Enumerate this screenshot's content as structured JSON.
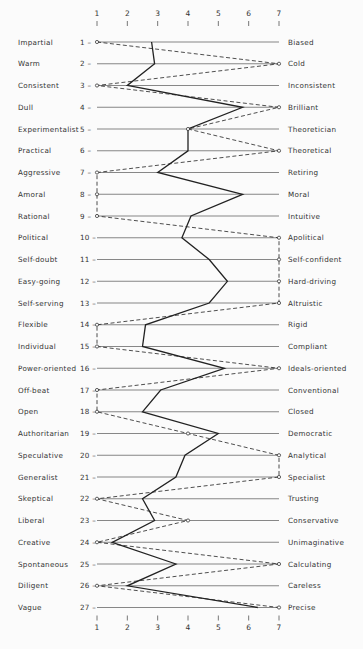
{
  "chart_data": {
    "type": "line",
    "title": "",
    "xlabel": "",
    "ylabel": "",
    "orientation": "horizontal-profile",
    "scale_ticks": [
      "1",
      "2",
      "3",
      "4",
      "5",
      "6",
      "7"
    ],
    "xlim": [
      1,
      7
    ],
    "grid": true,
    "items": [
      {
        "n": "1",
        "left": "Impartial",
        "right": "Biased"
      },
      {
        "n": "2",
        "left": "Warm",
        "right": "Cold"
      },
      {
        "n": "3",
        "left": "Consistent",
        "right": "Inconsistent"
      },
      {
        "n": "4",
        "left": "Dull",
        "right": "Brilliant"
      },
      {
        "n": "5",
        "left": "Experimentalist",
        "right": "Theoretician"
      },
      {
        "n": "6",
        "left": "Practical",
        "right": "Theoretical"
      },
      {
        "n": "7",
        "left": "Aggressive",
        "right": "Retiring"
      },
      {
        "n": "8",
        "left": "Amoral",
        "right": "Moral"
      },
      {
        "n": "9",
        "left": "Rational",
        "right": "Intuitive"
      },
      {
        "n": "10",
        "left": "Political",
        "right": "Apolitical"
      },
      {
        "n": "11",
        "left": "Self-doubt",
        "right": "Self-confident"
      },
      {
        "n": "12",
        "left": "Easy-going",
        "right": "Hard-driving"
      },
      {
        "n": "13",
        "left": "Self-serving",
        "right": "Altruistic"
      },
      {
        "n": "14",
        "left": "Flexible",
        "right": "Rigid"
      },
      {
        "n": "15",
        "left": "Individual",
        "right": "Compliant"
      },
      {
        "n": "16",
        "left": "Power-oriented",
        "right": "Ideals-oriented"
      },
      {
        "n": "17",
        "left": "Off-beat",
        "right": "Conventional"
      },
      {
        "n": "18",
        "left": "Open",
        "right": "Closed"
      },
      {
        "n": "19",
        "left": "Authoritarian",
        "right": "Democratic"
      },
      {
        "n": "20",
        "left": "Speculative",
        "right": "Analytical"
      },
      {
        "n": "21",
        "left": "Generalist",
        "right": "Specialist"
      },
      {
        "n": "22",
        "left": "Skeptical",
        "right": "Trusting"
      },
      {
        "n": "23",
        "left": "Liberal",
        "right": "Conservative"
      },
      {
        "n": "24",
        "left": "Creative",
        "right": "Unimaginative"
      },
      {
        "n": "25",
        "left": "Spontaneous",
        "right": "Calculating"
      },
      {
        "n": "26",
        "left": "Diligent",
        "right": "Careless"
      },
      {
        "n": "27",
        "left": "Vague",
        "right": "Precise"
      }
    ],
    "series": [
      {
        "name": "solid profile",
        "style": "solid",
        "values": [
          2.8,
          2.9,
          2.0,
          5.8,
          4.0,
          4.0,
          3.0,
          5.8,
          4.1,
          3.8,
          4.7,
          5.3,
          4.7,
          2.6,
          2.5,
          5.2,
          3.1,
          2.5,
          5.0,
          3.9,
          3.6,
          2.5,
          2.9,
          1.5,
          3.6,
          2.0,
          6.3
        ]
      },
      {
        "name": "dashed profile",
        "style": "dashed",
        "markers": "open-circle",
        "values": [
          1,
          7,
          1,
          7,
          4,
          7,
          1,
          1,
          1,
          7,
          7,
          7,
          7,
          1,
          1,
          7,
          1,
          1,
          4,
          7,
          7,
          1,
          4,
          1,
          7,
          1,
          7
        ]
      }
    ]
  },
  "colors": {
    "line": "#222222",
    "grid": "#555555",
    "background": "#fbfbfb"
  }
}
